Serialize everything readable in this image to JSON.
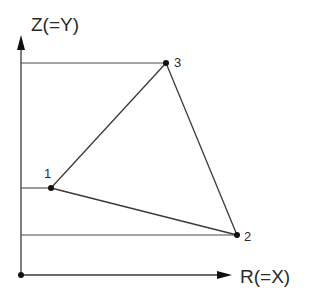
{
  "diagram": {
    "type": "coordinate-triangle",
    "axes": {
      "vertical_label": "Z(=Y)",
      "horizontal_label": "R(=X)",
      "origin": {
        "x": 21,
        "y": 275
      },
      "vertical_arrow_tip": {
        "x": 21,
        "y": 35
      },
      "horizontal_arrow_tip": {
        "x": 232,
        "y": 275
      }
    },
    "points": [
      {
        "id": "1",
        "label": "1",
        "x": 51,
        "y": 188
      },
      {
        "id": "2",
        "label": "2",
        "x": 237,
        "y": 235
      },
      {
        "id": "3",
        "label": "3",
        "x": 166,
        "y": 63
      }
    ],
    "edges": [
      {
        "from": "1",
        "to": "3"
      },
      {
        "from": "3",
        "to": "2"
      },
      {
        "from": "1",
        "to": "2"
      }
    ],
    "reference_lines": [
      {
        "to_point": "3"
      },
      {
        "to_point": "1"
      },
      {
        "to_point": "2"
      }
    ],
    "colors": {
      "line": "#3a3a3a",
      "dot": "#111111",
      "text": "#2a2a2a",
      "background": "#ffffff"
    }
  }
}
